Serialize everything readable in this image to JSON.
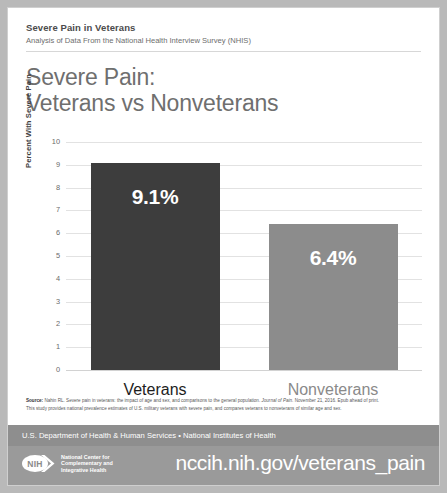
{
  "header": {
    "kicker": "Severe Pain in Veterans",
    "subkicker": "Analysis of Data From the National Health Interview Survey (NHIS)"
  },
  "title": {
    "line1": "Severe Pain:",
    "line2": "Veterans vs Nonveterans"
  },
  "chart_data": {
    "type": "bar",
    "title": "Severe Pain: Veterans vs Nonveterans",
    "xlabel": "",
    "ylabel": "Percent With Severe Pain",
    "categories": [
      "Veterans",
      "Nonveterans"
    ],
    "values": [
      9.1,
      6.4
    ],
    "data_labels": [
      "9.1%",
      "6.4%"
    ],
    "ylim": [
      0,
      10
    ],
    "yticks": [
      "10",
      "9",
      "8",
      "7",
      "6",
      "5",
      "4",
      "3",
      "2",
      "1",
      "0"
    ],
    "grid": true,
    "legend": "none",
    "bar_colors": [
      "#3d3d3d",
      "#8c8c8c"
    ],
    "category_label_colors": [
      "#1d1d1d",
      "#8a8a8a"
    ]
  },
  "source": {
    "label": "Source:",
    "citation_text": " Nahin RL. Severe pain in veterans: the impact of age and sex, and comparisons to the general population. ",
    "journal": "Journal of Pain",
    "citation_tail": ". November 21, 2016. Epub ahead of print.",
    "note": "This study provides national prevalence estimates of U.S. military veterans with severe pain, and compares veterans to nonveterans of similar age and sex."
  },
  "hhs_band": {
    "text": "U.S. Department of Health & Human Services • National Institutes of Health"
  },
  "footer": {
    "logo_mark": "NIH",
    "logo_line1": "National Center for",
    "logo_line2": "Complementary and",
    "logo_line3": "Integrative Health",
    "url": "nccih.nih.gov/veterans_pain"
  }
}
